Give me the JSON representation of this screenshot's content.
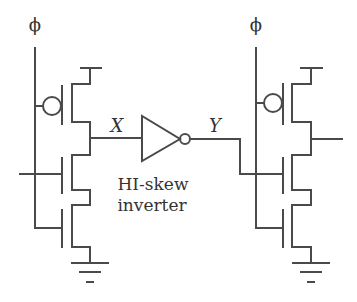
{
  "diagram": {
    "type": "circuit-schematic",
    "left_stage": {
      "clock_label": "ϕ",
      "output_node_label": "X",
      "devices": [
        "PMOS precharge (gate ϕ)",
        "NMOS input",
        "NMOS foot (gate ϕ)"
      ]
    },
    "inverter": {
      "line1": "HI-skew",
      "line2": "inverter"
    },
    "right_stage": {
      "clock_label": "ϕ",
      "input_node_label": "Y",
      "devices": [
        "PMOS precharge (gate ϕ)",
        "NMOS input (gate Y)",
        "NMOS foot (gate ϕ)"
      ]
    },
    "stroke_color": "#4a4a4a",
    "text_color": "#333333"
  }
}
